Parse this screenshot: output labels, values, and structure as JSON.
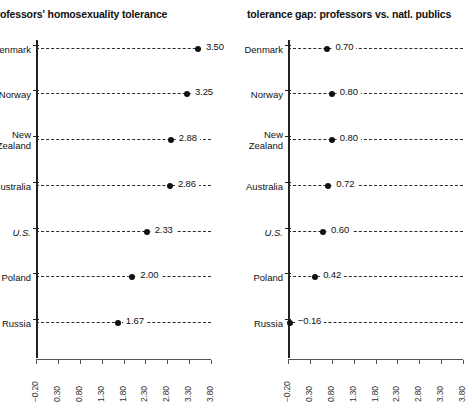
{
  "chart_data": [
    {
      "type": "scatter",
      "title": "rofessors' homosexuality tolerance",
      "xlabel": "",
      "ylabel": "",
      "categories": [
        "enmark",
        "Norway",
        "New\nZealand",
        "ustralia",
        "U.S.",
        "Poland",
        "Russia"
      ],
      "values": [
        3.5,
        3.25,
        2.88,
        2.86,
        2.33,
        2.0,
        1.67
      ],
      "value_labels": [
        "3.50",
        "3.25",
        "2.88",
        "2.86",
        "2.33",
        "2.00",
        "1.67"
      ],
      "italic_categories": [
        "U.S."
      ],
      "xlim": [
        -0.2,
        3.8
      ],
      "xticks": [
        -0.2,
        0.3,
        0.8,
        1.3,
        1.8,
        2.3,
        2.8,
        3.3,
        3.8
      ],
      "xtick_labels": [
        "−0.20",
        "0.30",
        "0.80",
        "1.30",
        "1.80",
        "2.30",
        "2.80",
        "3.30",
        "3.80"
      ],
      "grid": false,
      "legend": "none",
      "dash_style": "dashed",
      "dot_color": "#111111"
    },
    {
      "type": "scatter",
      "title": "tolerance gap: professors vs. natl. publics",
      "xlabel": "",
      "ylabel": "",
      "categories": [
        "Denmark",
        "Norway",
        "New\nZealand",
        "Australia",
        "U.S.",
        "Poland",
        "Russia"
      ],
      "values": [
        0.7,
        0.8,
        0.8,
        0.72,
        0.6,
        0.42,
        -0.16
      ],
      "value_labels": [
        "0.70",
        "0.80",
        "0.80",
        "0.72",
        "0.60",
        "0.42",
        "−0.16"
      ],
      "italic_categories": [
        "U.S."
      ],
      "xlim": [
        -0.2,
        3.8
      ],
      "xticks": [
        -0.2,
        0.3,
        0.8,
        1.3,
        1.8,
        2.3,
        2.8,
        3.3,
        3.8
      ],
      "xtick_labels": [
        "−0.20",
        "0.30",
        "0.80",
        "1.30",
        "1.80",
        "2.30",
        "2.80",
        "3.30",
        "3.80"
      ],
      "grid": false,
      "legend": "none",
      "dash_style": "dashed",
      "dot_color": "#111111"
    }
  ],
  "colors": {
    "background": "#ffffff",
    "text": "#111111",
    "axis": "#222222",
    "dash": "#2a2a2a"
  }
}
